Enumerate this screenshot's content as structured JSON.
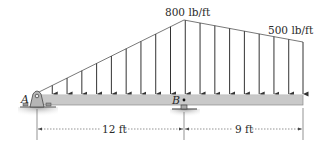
{
  "diagram": {
    "type": "beam-loading",
    "beam": {
      "color": "#c9c9c9",
      "edge_color": "#7a7a7a",
      "left_x": 35,
      "right_x": 303,
      "top_y": 95,
      "bottom_y": 105
    },
    "supports": [
      {
        "id": "A",
        "label": "A",
        "type": "pin",
        "x": 37
      },
      {
        "id": "B",
        "label": "B",
        "type": "roller",
        "x": 184
      }
    ],
    "distributed_load": {
      "shape": "linear-then-linear",
      "points": [
        {
          "x": 37,
          "value_lb_per_ft": 0
        },
        {
          "x": 184,
          "value_lb_per_ft": 800,
          "label": "800 lb/ft"
        },
        {
          "x": 303,
          "value_lb_per_ft": 500,
          "label": "500 lb/ft"
        }
      ],
      "arrow_count": 19
    },
    "dimensions": [
      {
        "label": "12 ft",
        "from_x": 37,
        "to_x": 184
      },
      {
        "label": "9 ft",
        "from_x": 184,
        "to_x": 303
      }
    ],
    "labels": {
      "load_peak": "800 lb/ft",
      "load_right": "500 lb/ft",
      "point_a": "A",
      "point_b": "B",
      "dim_left": "12 ft",
      "dim_right": "9 ft"
    }
  }
}
